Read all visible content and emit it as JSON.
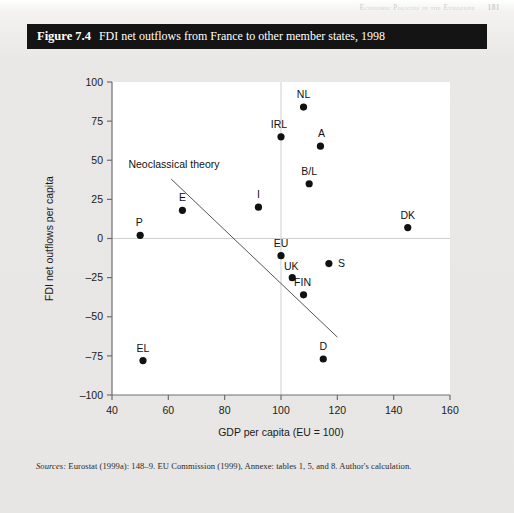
{
  "running_header": {
    "text": "Economic Policies in the Eurozone",
    "page_number": "181"
  },
  "figure": {
    "number": "Figure 7.4",
    "title": "FDI net outflows from France to other member states, 1998"
  },
  "sources": {
    "label": "Sources:",
    "text": " Eurostat (1999a): 148–9. EU Commission (1999), Annexe: tables 1, 5, and 8. Author's calculation."
  },
  "chart_data": {
    "type": "scatter",
    "title": "FDI net outflows from France to other member states, 1998",
    "xlabel": "GDP per capita (EU = 100)",
    "ylabel": "FDI net outflows per capita",
    "xlim": [
      40,
      160
    ],
    "ylim": [
      -100,
      100
    ],
    "xticks": [
      40,
      60,
      80,
      100,
      120,
      140,
      160
    ],
    "yticks": [
      100,
      75,
      50,
      25,
      0,
      -25,
      -50,
      -75,
      -100
    ],
    "grid": false,
    "reference_lines": [
      {
        "name": "eu-average-vertical",
        "axis": "x",
        "value": 100
      },
      {
        "name": "zero-horizontal",
        "axis": "y",
        "value": 0
      }
    ],
    "legend": "none",
    "annotations": [
      {
        "name": "neoclassical-theory",
        "text": "Neoclassical theory",
        "x": 62,
        "y": 45
      }
    ],
    "trendline": {
      "name": "neoclassical-theory-line",
      "x0": 61,
      "y0": 38,
      "x1": 120,
      "y1": -63
    },
    "points": [
      {
        "label": "NL",
        "x": 108,
        "y": 84
      },
      {
        "label": "IRL",
        "x": 100,
        "y": 65
      },
      {
        "label": "A",
        "x": 114,
        "y": 59
      },
      {
        "label": "B/L",
        "x": 110,
        "y": 35
      },
      {
        "label": "I",
        "x": 92,
        "y": 20
      },
      {
        "label": "E",
        "x": 65,
        "y": 18
      },
      {
        "label": "DK",
        "x": 145,
        "y": 7
      },
      {
        "label": "P",
        "x": 50,
        "y": 2
      },
      {
        "label": "EU",
        "x": 100,
        "y": -11
      },
      {
        "label": "S",
        "x": 117,
        "y": -16
      },
      {
        "label": "UK",
        "x": 104,
        "y": -25
      },
      {
        "label": "FIN",
        "x": 108,
        "y": -36
      },
      {
        "label": "D",
        "x": 115,
        "y": -77
      },
      {
        "label": "EL",
        "x": 51,
        "y": -78
      }
    ],
    "point_label_offsets": [
      {
        "label": "NL",
        "dx": 0,
        "dy": -9
      },
      {
        "label": "IRL",
        "dx": -2,
        "dy": -9
      },
      {
        "label": "A",
        "dx": 1,
        "dy": -9
      },
      {
        "label": "B/L",
        "dx": 0,
        "dy": -9
      },
      {
        "label": "I",
        "dx": 0,
        "dy": -9
      },
      {
        "label": "E",
        "dx": 0,
        "dy": -9
      },
      {
        "label": "DK",
        "dx": 0,
        "dy": -9
      },
      {
        "label": "P",
        "dx": -1,
        "dy": -9
      },
      {
        "label": "EU",
        "dx": 0,
        "dy": -9
      },
      {
        "label": "S",
        "dx": 9,
        "dy": 3
      },
      {
        "label": "UK",
        "dx": -1,
        "dy": -8
      },
      {
        "label": "FIN",
        "dx": -1,
        "dy": -9
      },
      {
        "label": "D",
        "dx": 0,
        "dy": -9
      },
      {
        "label": "EL",
        "dx": 0,
        "dy": -9
      }
    ]
  },
  "colors": {
    "banner_bg": "#141414",
    "banner_text": "#ffffff",
    "page_bg": "#e9e8e6",
    "plot_bg": "#ffffff",
    "point": "#111111",
    "axis": "#6e6e6e",
    "reference_line": "#cfcfcf"
  }
}
